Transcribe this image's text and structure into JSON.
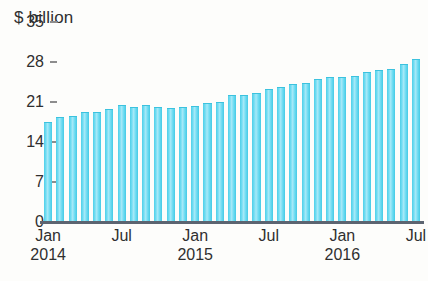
{
  "chart_data": {
    "type": "bar",
    "title": "$ billion",
    "xlabel": "",
    "ylabel": "$ billion",
    "ylim": [
      0,
      35
    ],
    "yticks": [
      0,
      7,
      14,
      21,
      28,
      35
    ],
    "ytick_labels": [
      "0",
      "7",
      "14",
      "21",
      "28",
      "35"
    ],
    "grid": false,
    "legend": "none",
    "categories": [
      "Jan 2014",
      "Feb 2014",
      "Mar 2014",
      "Apr 2014",
      "May 2014",
      "Jun 2014",
      "Jul 2014",
      "Aug 2014",
      "Sep 2014",
      "Oct 2014",
      "Nov 2014",
      "Dec 2014",
      "Jan 2015",
      "Feb 2015",
      "Mar 2015",
      "Apr 2015",
      "May 2015",
      "Jun 2015",
      "Jul 2015",
      "Aug 2015",
      "Sep 2015",
      "Oct 2015",
      "Nov 2015",
      "Dec 2015",
      "Jan 2016",
      "Feb 2016",
      "Mar 2016",
      "Apr 2016",
      "May 2016",
      "Jun 2016",
      "Jul 2016"
    ],
    "values": [
      17.5,
      18.4,
      18.6,
      19.3,
      19.2,
      19.8,
      20.4,
      20.2,
      20.5,
      20.1,
      20.0,
      20.1,
      20.3,
      20.8,
      21.0,
      22.2,
      22.3,
      22.5,
      23.2,
      23.6,
      24.2,
      24.4,
      25.1,
      25.4,
      25.3,
      25.6,
      26.2,
      26.6,
      26.8,
      27.6,
      28.6
    ],
    "x_axis_ticks": [
      {
        "month": "Jan",
        "year": "2014",
        "index": 0
      },
      {
        "month": "Jul",
        "year": "",
        "index": 6
      },
      {
        "month": "Jan",
        "year": "2015",
        "index": 12
      },
      {
        "month": "Jul",
        "year": "",
        "index": 18
      },
      {
        "month": "Jan",
        "year": "2016",
        "index": 24
      },
      {
        "month": "Jul",
        "year": "",
        "index": 30
      }
    ],
    "colors": {
      "bar": "#6fdcf2",
      "bar_edge": "#3cc2de",
      "bar_highlight": "#a7e9f8",
      "axis_line": "#5c6470",
      "tick_mark": "#8d8d8d",
      "text": "#2f2f2f",
      "background": "#fdfdfb"
    }
  }
}
